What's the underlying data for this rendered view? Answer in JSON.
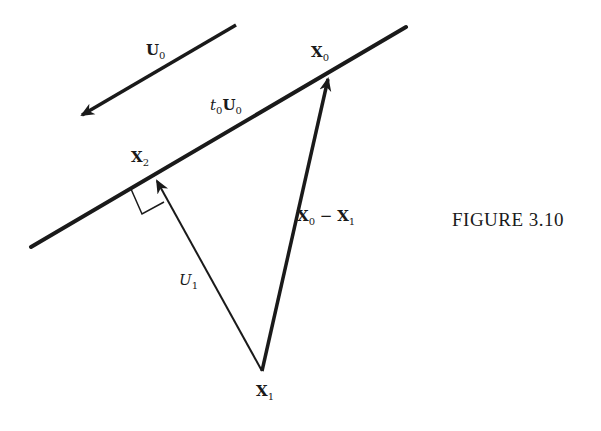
{
  "diagram": {
    "caption": "FIGURE 3.10",
    "labels": {
      "u0": {
        "main": "U",
        "sub": "0"
      },
      "t0u0": {
        "prefix": "t",
        "prefix_sub": "0",
        "main": "U",
        "sub": "0"
      },
      "x0": {
        "main": "X",
        "sub": "0"
      },
      "x2": {
        "main": "X",
        "sub": "2"
      },
      "x1": {
        "main": "X",
        "sub": "1"
      },
      "u1": {
        "main": "U",
        "sub": "1"
      },
      "x0_minus_x1": {
        "a": "X",
        "a_sub": "0",
        "op": "−",
        "b": "X",
        "b_sub": "1"
      }
    },
    "colors": {
      "ink": "#1a1a1a",
      "background": "#ffffff"
    }
  }
}
